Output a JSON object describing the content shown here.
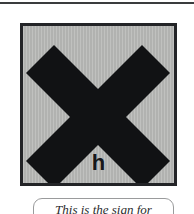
{
  "page": {
    "background_color": "#ffffff",
    "rule_color": "#3a3c3e"
  },
  "sign": {
    "kind": "hazard-warning-sign",
    "symbol_icon": "x-cross-icon",
    "hazard_letter": "h",
    "plate_color": "#b7b8b6",
    "frame_color": "#232427",
    "symbol_color": "#111214"
  },
  "caption": {
    "text": "This is the sign for",
    "border_color": "#9a9b9c",
    "text_color": "#2b2c2e"
  }
}
